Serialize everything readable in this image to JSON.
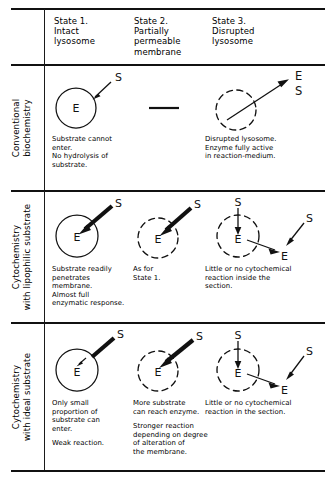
{
  "figure": {
    "title_present": false,
    "columns": [
      {
        "id": "state1",
        "l1": "State 1.",
        "l2": "Intact",
        "l3": "lysosome",
        "l4": ""
      },
      {
        "id": "state2",
        "l1": "State 2.",
        "l2": "Partially",
        "l3": "permeable",
        "l4": "membrane"
      },
      {
        "id": "state3",
        "l1": "State 3.",
        "l2": "Disrupted",
        "l3": "lysosome",
        "l4": ""
      }
    ],
    "rows": [
      {
        "id": "conventional-biochemistry",
        "label_line1": "Conventional",
        "label_line2": "biochemistry"
      },
      {
        "id": "cytochemistry-lipophilic",
        "label_line1": "Cytochemistry",
        "label_line2": "with lipophilic substrate"
      },
      {
        "id": "cytochemistry-ideal",
        "label_line1": "Cytochemistry",
        "label_line2": "with ideal substrate"
      }
    ],
    "glyphs": {
      "enzyme": "E",
      "substrate": "S"
    },
    "cells": {
      "r1c1": {
        "caption": [
          "Substrate cannot enter.",
          "No hydrolysis of",
          "substrate."
        ]
      },
      "r1c2": {
        "caption": []
      },
      "r1c3": {
        "caption": [
          "Disrupted lysosome.",
          "Enzyme fully active",
          "in reaction-medium."
        ]
      },
      "r2c1": {
        "caption": [
          "Substrate readily",
          "penetrates",
          "membrane.",
          "Almost full",
          "enzymatic response."
        ]
      },
      "r2c2": {
        "caption": [
          "As for",
          "State 1."
        ]
      },
      "r2c3": {
        "caption": [
          "Little or no cytochemical",
          "reaction inside the",
          "section."
        ]
      },
      "r3c1": {
        "caption": [
          "Only small",
          "proportion of",
          "substrate can",
          "enter.",
          "Weak reaction."
        ]
      },
      "r3c2": {
        "caption": [
          "More substrate",
          "can reach enzyme.",
          "Stronger reaction",
          "depending on degree",
          "of alteration of",
          "the membrane."
        ]
      },
      "r3c3": {
        "caption": [
          "Little or no cytochemical",
          "reaction in the section."
        ]
      }
    },
    "colors": {
      "ink": "#111111",
      "background": "#ffffff"
    }
  }
}
